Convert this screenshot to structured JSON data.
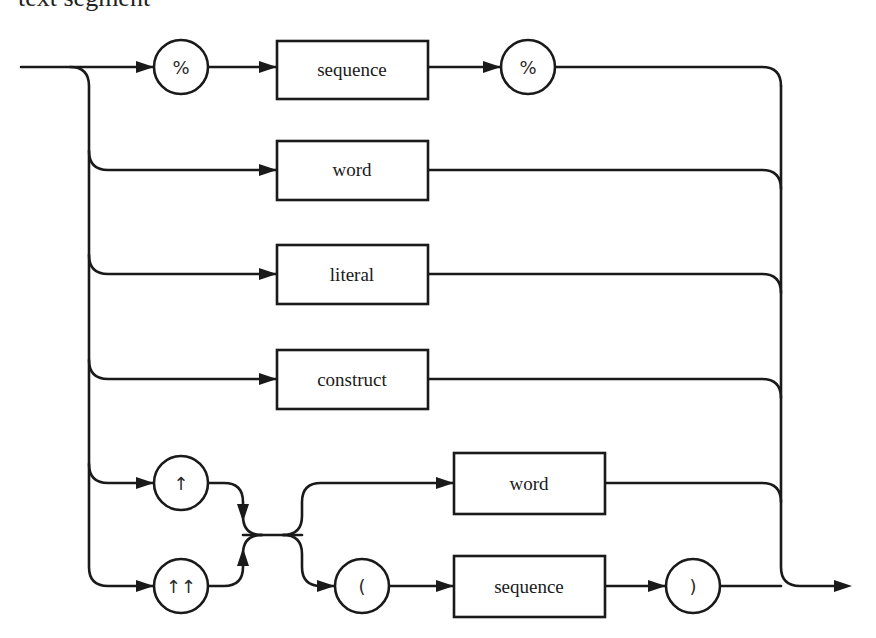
{
  "title": "text segment",
  "diagram": {
    "type": "syntax (railroad) diagram",
    "entry": "start",
    "exit": "end",
    "alternatives": [
      {
        "id": "percent-sequence",
        "elements": [
          {
            "kind": "terminal",
            "label": "%"
          },
          {
            "kind": "nonterminal",
            "label": "sequence"
          },
          {
            "kind": "terminal",
            "label": "%"
          }
        ]
      },
      {
        "id": "word",
        "elements": [
          {
            "kind": "nonterminal",
            "label": "word"
          }
        ]
      },
      {
        "id": "literal",
        "elements": [
          {
            "kind": "nonterminal",
            "label": "literal"
          }
        ]
      },
      {
        "id": "construct",
        "elements": [
          {
            "kind": "nonterminal",
            "label": "construct"
          }
        ]
      },
      {
        "id": "arrow-reference",
        "elements": [
          {
            "kind": "choice",
            "options": [
              {
                "kind": "terminal",
                "label": "↑"
              },
              {
                "kind": "terminal",
                "label": "↑↑"
              }
            ]
          },
          {
            "kind": "choice",
            "options": [
              [
                {
                  "kind": "nonterminal",
                  "label": "word"
                }
              ],
              [
                {
                  "kind": "terminal",
                  "label": "("
                },
                {
                  "kind": "nonterminal",
                  "label": "sequence"
                },
                {
                  "kind": "terminal",
                  "label": ")"
                }
              ]
            ]
          }
        ]
      }
    ]
  },
  "nodes": {
    "pct1": "%",
    "seq1": "sequence",
    "pct2": "%",
    "word1": "word",
    "literal": "literal",
    "construct": "construct",
    "up1": "↑",
    "up2": "↑↑",
    "word2": "word",
    "lparen": "(",
    "seq2": "sequence",
    "rparen": ")"
  }
}
